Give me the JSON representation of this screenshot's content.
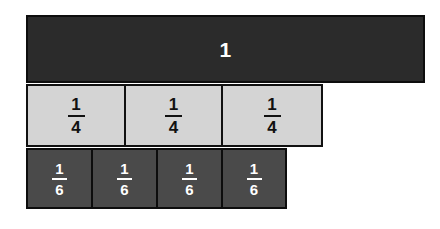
{
  "diagram": {
    "background_color": "#ffffff",
    "rows": [
      {
        "name": "whole",
        "fill_color": "#2b2b2b",
        "text_color": "#ffffff",
        "cells": [
          {
            "label": "1",
            "numerator": "1",
            "denominator": ""
          }
        ]
      },
      {
        "name": "quarters",
        "fill_color": "#d4d4d4",
        "text_color": "#111111",
        "cells": [
          {
            "label": "1/4",
            "numerator": "1",
            "denominator": "4"
          },
          {
            "label": "1/4",
            "numerator": "1",
            "denominator": "4"
          },
          {
            "label": "1/4",
            "numerator": "1",
            "denominator": "4"
          }
        ]
      },
      {
        "name": "sixths",
        "fill_color": "#4a4a4a",
        "text_color": "#ffffff",
        "cells": [
          {
            "label": "1/6",
            "numerator": "1",
            "denominator": "6"
          },
          {
            "label": "1/6",
            "numerator": "1",
            "denominator": "6"
          },
          {
            "label": "1/6",
            "numerator": "1",
            "denominator": "6"
          },
          {
            "label": "1/6",
            "numerator": "1",
            "denominator": "6"
          }
        ]
      }
    ]
  }
}
